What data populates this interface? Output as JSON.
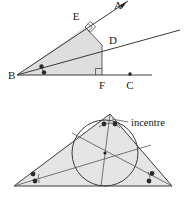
{
  "figure": {
    "background_color": "#ffffff",
    "line_color": "#4a4a4a",
    "fill_color": "#d8d8d8",
    "label_color": "#1a1a1a"
  },
  "upper_diagram": {
    "name": "angle-bisector-equidistant-diagram",
    "description": "Angle ABC with bisector BD; perpendiculars DE and DF to the two arms",
    "labels": {
      "A": "A",
      "B": "B",
      "C": "C",
      "D": "D",
      "E": "E",
      "F": "F"
    },
    "points": {
      "A": {
        "x": 124,
        "y": 2
      },
      "B": {
        "x": 17,
        "y": 75
      },
      "C": {
        "x": 130,
        "y": 75
      },
      "D": {
        "x": 102,
        "y": 45
      },
      "E": {
        "x": 85,
        "y": 27
      },
      "F": {
        "x": 102,
        "y": 75
      }
    },
    "right_angles": [
      "E",
      "F"
    ],
    "equal_angle_marks": 2,
    "marked_points": [
      "A",
      "C"
    ]
  },
  "lower_diagram": {
    "name": "incentre-diagram",
    "description": "Triangle with three angle bisectors meeting at the incentre and the inscribed circle",
    "caption": "incentre",
    "vertices": {
      "top": {
        "x": 110,
        "y": 114
      },
      "left": {
        "x": 14,
        "y": 186
      },
      "right": {
        "x": 172,
        "y": 186
      }
    },
    "incentre": {
      "x": 105,
      "y": 153
    },
    "incircle_radius": 33,
    "equal_angle_marks_per_vertex": 2,
    "bisector_count": 3
  }
}
